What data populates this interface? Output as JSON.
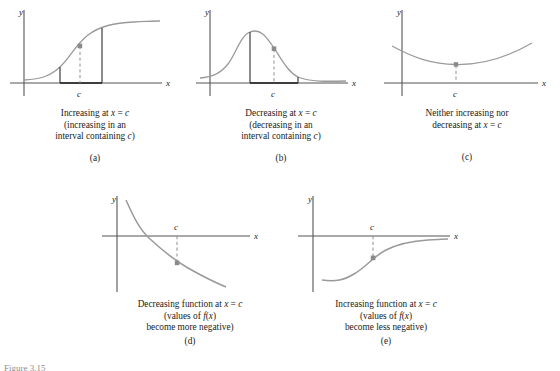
{
  "figure": {
    "title_fragment": "Figure 3.15",
    "axis_labels": {
      "x": "x",
      "y": "y",
      "point": "c"
    }
  },
  "panels": [
    {
      "id": "a",
      "letter": "(a)",
      "caption_lines": [
        {
          "parts": [
            {
              "t": "Increasing at ",
              "i": false
            },
            {
              "t": "x",
              "i": true
            },
            {
              "t": " = ",
              "i": false
            },
            {
              "t": "c",
              "i": true
            }
          ]
        },
        {
          "parts": [
            {
              "t": "(increasing in an",
              "i": false
            }
          ]
        },
        {
          "parts": [
            {
              "t": "interval containing ",
              "i": false
            },
            {
              "t": "c",
              "i": true
            },
            {
              "t": ")",
              "i": false
            }
          ]
        }
      ],
      "curve": "increasing-sigmoid",
      "marker_label": "c"
    },
    {
      "id": "b",
      "letter": "(b)",
      "caption_lines": [
        {
          "parts": [
            {
              "t": "Decreasing at ",
              "i": false
            },
            {
              "t": "x",
              "i": true
            },
            {
              "t": " = ",
              "i": false
            },
            {
              "t": "c",
              "i": true
            }
          ]
        },
        {
          "parts": [
            {
              "t": "(decreasing in an",
              "i": false
            }
          ]
        },
        {
          "parts": [
            {
              "t": "interval containing ",
              "i": false
            },
            {
              "t": "c",
              "i": true
            },
            {
              "t": ")",
              "i": false
            }
          ]
        }
      ],
      "curve": "bell-curve",
      "marker_label": "c"
    },
    {
      "id": "c",
      "letter": "(c)",
      "caption_lines": [
        {
          "parts": [
            {
              "t": "Neither increasing nor",
              "i": false
            }
          ]
        },
        {
          "parts": [
            {
              "t": "decreasing at ",
              "i": false
            },
            {
              "t": "x",
              "i": true
            },
            {
              "t": " = ",
              "i": false
            },
            {
              "t": "c",
              "i": true
            }
          ]
        }
      ],
      "curve": "parabola-minimum",
      "marker_label": "c"
    },
    {
      "id": "d",
      "letter": "(d)",
      "caption_lines": [
        {
          "parts": [
            {
              "t": "Decreasing function at ",
              "i": false
            },
            {
              "t": "x",
              "i": true
            },
            {
              "t": " = ",
              "i": false
            },
            {
              "t": "c",
              "i": true
            }
          ]
        },
        {
          "parts": [
            {
              "t": "(values of ",
              "i": false
            },
            {
              "t": "f",
              "i": true
            },
            {
              "t": "(",
              "i": false
            },
            {
              "t": "x",
              "i": true
            },
            {
              "t": ")",
              "i": false
            }
          ]
        },
        {
          "parts": [
            {
              "t": "become more negative)",
              "i": false
            }
          ]
        }
      ],
      "curve": "decaying-exponential",
      "marker_label": "c"
    },
    {
      "id": "e",
      "letter": "(e)",
      "caption_lines": [
        {
          "parts": [
            {
              "t": "Increasing function at ",
              "i": false
            },
            {
              "t": "x",
              "i": true
            },
            {
              "t": " = ",
              "i": false
            },
            {
              "t": "c",
              "i": true
            }
          ]
        },
        {
          "parts": [
            {
              "t": "(values of ",
              "i": false
            },
            {
              "t": "f",
              "i": true
            },
            {
              "t": "(",
              "i": false
            },
            {
              "t": "x",
              "i": true
            },
            {
              "t": ")",
              "i": false
            }
          ]
        },
        {
          "parts": [
            {
              "t": "become less negative)",
              "i": false
            }
          ]
        }
      ],
      "curve": "rising-sigmoid-below-axis",
      "marker_label": "c"
    }
  ],
  "colors": {
    "curve": "#8f8f8f",
    "axis": "#555555",
    "accent_dark": "#3d3d3d",
    "dashed": "#9a9a9a",
    "marker": "#8a8a8a",
    "text": "#1a1a1a",
    "faded_text": "#9a9a9a"
  }
}
